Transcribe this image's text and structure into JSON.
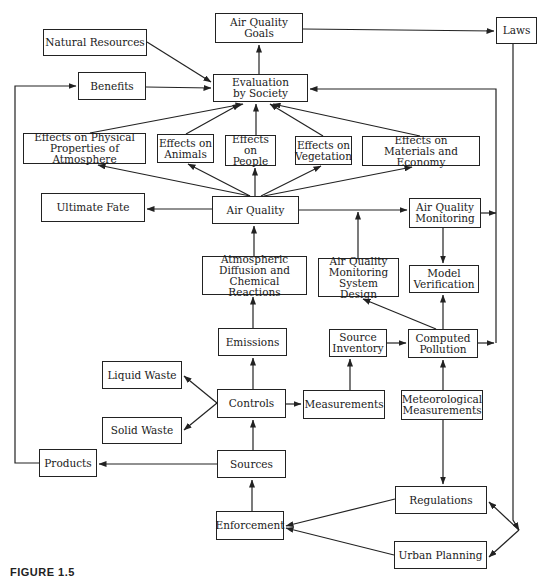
{
  "diagram": {
    "caption": "FIGURE 1.5",
    "nodes": {
      "air_quality_goals": {
        "label": "Air Quality\nGoals",
        "x": 215,
        "y": 13,
        "w": 88,
        "h": 30
      },
      "laws": {
        "label": "Laws",
        "x": 496,
        "y": 17,
        "w": 41,
        "h": 27
      },
      "natural_resources": {
        "label": "Natural Resources",
        "x": 43,
        "y": 29,
        "w": 104,
        "h": 27
      },
      "benefits": {
        "label": "Benefits",
        "x": 78,
        "y": 72,
        "w": 68,
        "h": 28
      },
      "evaluation_by_society": {
        "label": "Evaluation\nby Society",
        "x": 213,
        "y": 74,
        "w": 95,
        "h": 28
      },
      "effects_physical": {
        "label": "Effects on Physical\nProperties of Atmosphere",
        "x": 23,
        "y": 133,
        "w": 123,
        "h": 31
      },
      "effects_animals": {
        "label": "Effects on\nAnimals",
        "x": 157,
        "y": 134,
        "w": 57,
        "h": 29
      },
      "effects_people": {
        "label": "Effects on\nPeople",
        "x": 225,
        "y": 135,
        "w": 51,
        "h": 31
      },
      "effects_vegetation": {
        "label": "Effects on\nVegetation",
        "x": 295,
        "y": 136,
        "w": 57,
        "h": 29
      },
      "effects_materials": {
        "label": "Effects on\nMaterials and Economy",
        "x": 362,
        "y": 136,
        "w": 118,
        "h": 30
      },
      "ultimate_fate": {
        "label": "Ultimate Fate",
        "x": 41,
        "y": 193,
        "w": 104,
        "h": 29
      },
      "air_quality": {
        "label": "Air Quality",
        "x": 212,
        "y": 196,
        "w": 87,
        "h": 28
      },
      "air_quality_monitoring": {
        "label": "Air Quality\nMonitoring",
        "x": 409,
        "y": 198,
        "w": 72,
        "h": 30
      },
      "atmospheric_diffusion": {
        "label": "Atmospheric\nDiffusion and\nChemical Reactions",
        "x": 202,
        "y": 256,
        "w": 105,
        "h": 39
      },
      "aq_monitoring_design": {
        "label": "Air Quality\nMonitoring\nSystem Design",
        "x": 318,
        "y": 258,
        "w": 81,
        "h": 39
      },
      "model_verification": {
        "label": "Model\nVerification",
        "x": 409,
        "y": 265,
        "w": 70,
        "h": 28
      },
      "emissions": {
        "label": "Emissions",
        "x": 218,
        "y": 328,
        "w": 69,
        "h": 28
      },
      "source_inventory": {
        "label": "Source\nInventory",
        "x": 329,
        "y": 329,
        "w": 58,
        "h": 28
      },
      "computed_pollution": {
        "label": "Computed\nPollution",
        "x": 408,
        "y": 329,
        "w": 70,
        "h": 29
      },
      "liquid_waste": {
        "label": "Liquid Waste",
        "x": 102,
        "y": 361,
        "w": 80,
        "h": 28
      },
      "controls": {
        "label": "Controls",
        "x": 217,
        "y": 389,
        "w": 69,
        "h": 29
      },
      "measurements": {
        "label": "Measurements",
        "x": 303,
        "y": 390,
        "w": 82,
        "h": 29
      },
      "meteorological_measurements": {
        "label": "Meteorological\nMeasurements",
        "x": 401,
        "y": 390,
        "w": 82,
        "h": 30
      },
      "solid_waste": {
        "label": "Solid Waste",
        "x": 102,
        "y": 417,
        "w": 80,
        "h": 27
      },
      "products": {
        "label": "Products",
        "x": 39,
        "y": 449,
        "w": 58,
        "h": 28
      },
      "sources": {
        "label": "Sources",
        "x": 217,
        "y": 450,
        "w": 69,
        "h": 28
      },
      "regulations": {
        "label": "Regulations",
        "x": 395,
        "y": 486,
        "w": 92,
        "h": 28
      },
      "enforcement": {
        "label": "Enforcement",
        "x": 216,
        "y": 511,
        "w": 68,
        "h": 29
      },
      "urban_planning": {
        "label": "Urban Planning",
        "x": 394,
        "y": 541,
        "w": 93,
        "h": 28
      }
    },
    "edges": [
      {
        "from": "natural_resources",
        "to": "evaluation_by_society",
        "d": "M147,42 L211,82"
      },
      {
        "from": "benefits",
        "to": "evaluation_by_society",
        "d": "M146,87 L211,88"
      },
      {
        "from": "evaluation_by_society",
        "to": "air_quality_goals",
        "d": "M259,74 L259,45"
      },
      {
        "from": "air_quality_goals",
        "to": "laws",
        "d": "M303,29 L494,31"
      },
      {
        "from": "laws",
        "to": "urban_planning",
        "d": "M513,44 L513,520 L519,530"
      },
      {
        "from": "laws_branch",
        "to": "regulations",
        "d": "M519,530 L489,502"
      },
      {
        "from": "laws_branch",
        "to": "urban_planning",
        "d": "M519,530 L489,557"
      },
      {
        "from": "effects_physical",
        "to": "evaluation_by_society",
        "d": "M90,133 L243,104"
      },
      {
        "from": "effects_animals",
        "to": "evaluation_by_society",
        "d": "M186,134 L240,104"
      },
      {
        "from": "effects_people",
        "to": "evaluation_by_society",
        "d": "M256,135 L256,104"
      },
      {
        "from": "effects_vegetation",
        "to": "evaluation_by_society",
        "d": "M323,136 L270,104"
      },
      {
        "from": "effects_materials",
        "to": "evaluation_by_society",
        "d": "M420,136 L273,104"
      },
      {
        "from": "air_quality",
        "to": "effects_physical",
        "d": "M250,196 L98,165"
      },
      {
        "from": "air_quality",
        "to": "effects_animals",
        "d": "M250,196 L188,164"
      },
      {
        "from": "air_quality",
        "to": "effects_people",
        "d": "M255,196 L255,168"
      },
      {
        "from": "air_quality",
        "to": "effects_vegetation",
        "d": "M261,196 L321,166"
      },
      {
        "from": "air_quality",
        "to": "effects_materials",
        "d": "M264,196 L412,167"
      },
      {
        "from": "air_quality",
        "to": "ultimate_fate",
        "d": "M212,209 L147,209"
      },
      {
        "from": "air_quality",
        "to": "air_quality_monitoring",
        "d": "M299,210 L407,210"
      },
      {
        "from": "aq_monitoring_design",
        "to": "aq_line",
        "d": "M358,258 L358,212"
      },
      {
        "from": "atmospheric_diffusion",
        "to": "air_quality",
        "d": "M254,256 L254,226"
      },
      {
        "from": "air_quality_monitoring",
        "to": "model_verification",
        "d": "M443,228 L443,263"
      },
      {
        "from": "air_quality_monitoring",
        "to": "right_bus",
        "d": "M481,213 L496,213"
      },
      {
        "from": "right_bus",
        "to": "evaluation_by_society",
        "d": "M496,343 L496,89 L310,89"
      },
      {
        "from": "computed_pollution",
        "to": "right_bus",
        "d": "M478,343 L494,343"
      },
      {
        "from": "computed_pollution",
        "to": "aq_monitoring_design",
        "d": "M436,329 L363,299"
      },
      {
        "from": "computed_pollution",
        "to": "model_verification",
        "d": "M443,329 L443,295"
      },
      {
        "from": "source_inventory",
        "to": "computed_pollution",
        "d": "M387,343 L406,343"
      },
      {
        "from": "measurements",
        "to": "source_inventory",
        "d": "M350,390 L350,359"
      },
      {
        "from": "meteorological_measurements",
        "to": "computed_pollution",
        "d": "M443,390 L443,360"
      },
      {
        "from": "meteorological_measurements",
        "to": "regulations",
        "d": "M443,420 L443,484"
      },
      {
        "from": "emissions",
        "to": "atmospheric_diffusion",
        "d": "M253,328 L253,297"
      },
      {
        "from": "controls",
        "to": "emissions",
        "d": "M253,389 L253,358"
      },
      {
        "from": "controls",
        "to": "measurements",
        "d": "M286,404 L301,404"
      },
      {
        "from": "controls",
        "to": "liquid_waste",
        "d": "M217,403 L184,376"
      },
      {
        "from": "controls",
        "to": "solid_waste",
        "d": "M217,403 L184,430"
      },
      {
        "from": "sources",
        "to": "controls",
        "d": "M253,450 L253,420"
      },
      {
        "from": "sources",
        "to": "products",
        "d": "M217,464 L99,464"
      },
      {
        "from": "products",
        "to": "benefits",
        "d": "M39,463 L15,463 L15,86 L76,86"
      },
      {
        "from": "enforcement",
        "to": "sources",
        "d": "M252,511 L252,480"
      },
      {
        "from": "regulations",
        "to": "enforcement",
        "d": "M395,499 L286,526"
      },
      {
        "from": "urban_planning",
        "to": "enforcement",
        "d": "M394,555 L286,528"
      }
    ]
  }
}
